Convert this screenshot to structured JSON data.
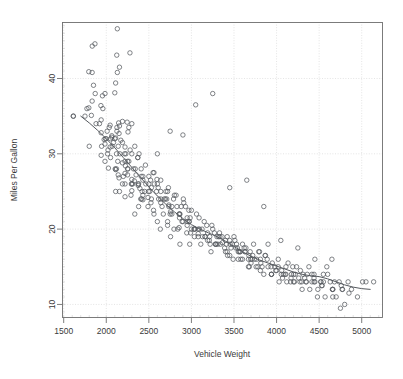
{
  "chart_data": {
    "type": "scatter",
    "title": "",
    "xlabel": "Vehicle Weight",
    "ylabel": "Miles Per Gallon",
    "xlim": [
      1480,
      5250
    ],
    "ylim": [
      8.2,
      47.5
    ],
    "xticks": [
      1500,
      2000,
      2500,
      3000,
      3500,
      4000,
      4500,
      5000
    ],
    "xtick_labels": [
      "1500",
      "2000",
      "2500",
      "3000",
      "3500",
      "4000",
      "4500",
      "5000"
    ],
    "yticks": [
      10,
      20,
      30,
      40
    ],
    "ytick_labels": [
      "10",
      "20",
      "30",
      "40"
    ],
    "grid": true,
    "grid_style": "dotted",
    "grid_color": "#d8d8d8",
    "legend": null,
    "marker": "open-circle",
    "marker_size": 3,
    "point_color": "#555a5f",
    "frame_color": "#6e6e6e",
    "series": [
      {
        "name": "Vehicles",
        "type": "scatter",
        "x": [
          1835,
          1613,
          1834,
          1955,
          2278,
          1867,
          1795,
          1850,
          2130,
          1795,
          1825,
          1773,
          1613,
          1834,
          2123,
          1937,
          1940,
          1985,
          2045,
          2155,
          2130,
          2110,
          2100,
          1940,
          2035,
          2145,
          2065,
          1945,
          2190,
          2125,
          1975,
          2155,
          1985,
          2065,
          2045,
          2300,
          2265,
          2110,
          2085,
          2215,
          1800,
          1985,
          2245,
          2150,
          2020,
          2125,
          2171,
          2220,
          2255,
          2300,
          1940,
          2050,
          2120,
          2220,
          2140,
          2225,
          2190,
          2110,
          2025,
          2335,
          2265,
          2385,
          2220,
          2150,
          2330,
          2250,
          2300,
          2370,
          2190,
          2410,
          2350,
          2300,
          2430,
          2375,
          2155,
          2600,
          2395,
          2300,
          2464,
          2220,
          2290,
          2295,
          2405,
          2430,
          2500,
          2530,
          2565,
          2595,
          2560,
          2380,
          2430,
          2490,
          2525,
          2640,
          2600,
          2695,
          2720,
          2655,
          2710,
          2755,
          2735,
          2800,
          2830,
          2865,
          2905,
          2930,
          2950,
          2985,
          3000,
          3035,
          2110,
          2220,
          2335,
          2415,
          2450,
          2490,
          2555,
          2600,
          2670,
          2720,
          2795,
          2855,
          2890,
          2945,
          2980,
          3035,
          3080,
          3125,
          3160,
          3210,
          3250,
          3285,
          3320,
          3365,
          3400,
          3425,
          3465,
          3500,
          3530,
          3570,
          3600,
          3640,
          3675,
          3700,
          3730,
          3765,
          3800,
          3830,
          3865,
          3900,
          3940,
          3980,
          4020,
          4060,
          4100,
          4135,
          4165,
          4200,
          4235,
          4275,
          4310,
          4345,
          4380,
          4415,
          4450,
          4485,
          4520,
          4550,
          4590,
          4630,
          4660,
          4700,
          4735,
          4770,
          4800,
          4840,
          4880,
          4950,
          5010,
          5140,
          2560,
          2720,
          2840,
          2950,
          3080,
          3190,
          3280,
          3390,
          3480,
          3550,
          3620,
          3710,
          3790,
          3870,
          3950,
          4020,
          4110,
          4190,
          4280,
          4360,
          4440,
          4520,
          4600,
          4680,
          4760,
          2635,
          2755,
          2865,
          2990,
          3110,
          3230,
          3340,
          3450,
          3560,
          3670,
          3780,
          3890,
          4000,
          4110,
          4220,
          4330,
          4440,
          4550,
          4660,
          2105,
          2200,
          2310,
          2420,
          2530,
          2640,
          2750,
          2860,
          2970,
          3080,
          3190,
          3300,
          3410,
          3520,
          3630,
          3740,
          1990,
          2070,
          2160,
          2250,
          2340,
          2430,
          2520,
          2610,
          2700,
          2790,
          2880,
          2970,
          3060,
          3150,
          3240,
          3330,
          3420,
          3510,
          3600,
          3690,
          1920,
          2010,
          2100,
          2190,
          2280,
          2370,
          2460,
          2550,
          2640,
          2730,
          2820,
          2910,
          3000,
          3090,
          3180,
          3270,
          3360,
          3450,
          3540,
          3630,
          3720,
          3810,
          3900,
          3990,
          4080,
          4170,
          4260,
          4350,
          4440,
          4530,
          2015,
          2135,
          2255,
          2375,
          2495,
          2615,
          2735,
          2855,
          2975,
          3095,
          3215,
          3335,
          3455,
          3575,
          3695,
          3815,
          3935,
          4055,
          4175,
          4295,
          4415,
          4535,
          4655,
          4775,
          1870,
          1960,
          2050,
          2140,
          2230,
          2320,
          2410,
          2500,
          2590,
          2680,
          2770,
          2860,
          2950,
          3040,
          3130,
          3220,
          3310,
          3400,
          3490,
          3580,
          3670,
          3760,
          3850,
          3940,
          4030,
          4120,
          4210,
          4300,
          4390,
          4480,
          4570,
          4660,
          4750,
          3250,
          3050,
          2900,
          2750,
          3450,
          3650,
          3850,
          4050,
          4250,
          4450,
          4650,
          4850,
          5050,
          1750,
          1880,
          2000,
          2120,
          2250,
          2380,
          2510,
          2640,
          2770,
          2900,
          3030,
          3160,
          3290,
          3420,
          3550,
          3680,
          3810,
          3940,
          4070,
          4200
        ],
        "y": [
          44.3,
          35.0,
          40.8,
          37.7,
          43.4,
          44.6,
          40.9,
          39.1,
          46.6,
          36.1,
          35.1,
          36.0,
          35.0,
          37.0,
          43.1,
          36.4,
          34.5,
          38.0,
          33.8,
          41.5,
          40.8,
          39.4,
          38.1,
          32.8,
          33.5,
          34.1,
          32.4,
          31.0,
          34.3,
          33.0,
          31.9,
          33.7,
          31.3,
          32.2,
          30.9,
          34.0,
          33.5,
          32.1,
          31.5,
          30.0,
          31.0,
          29.0,
          34.2,
          32.7,
          30.5,
          33.5,
          31.8,
          30.9,
          32.9,
          30.0,
          29.8,
          29.5,
          28.0,
          29.0,
          27.2,
          28.4,
          28.8,
          27.9,
          28.1,
          31.0,
          29.0,
          30.0,
          27.4,
          26.8,
          26.4,
          27.2,
          26.6,
          29.5,
          26.0,
          28.0,
          27.2,
          26.0,
          26.5,
          25.8,
          25.0,
          30.0,
          25.4,
          25.1,
          26.0,
          24.3,
          24.5,
          26.0,
          24.0,
          24.5,
          27.0,
          25.5,
          26.0,
          26.6,
          27.5,
          23.0,
          23.9,
          24.2,
          23.5,
          25.0,
          26.0,
          24.0,
          25.0,
          23.0,
          24.0,
          22.3,
          23.2,
          24.5,
          23.0,
          22.0,
          24.0,
          23.0,
          20.5,
          21.5,
          20.0,
          19.0,
          25.0,
          26.0,
          22.0,
          24.0,
          25.0,
          23.0,
          22.5,
          21.0,
          22.0,
          20.5,
          20.0,
          20.2,
          21.0,
          19.5,
          18.0,
          20.0,
          19.4,
          20.0,
          19.0,
          18.5,
          20.0,
          18.0,
          19.0,
          18.2,
          18.5,
          16.5,
          17.5,
          19.0,
          18.0,
          17.0,
          16.0,
          17.5,
          16.5,
          15.5,
          18.0,
          16.0,
          17.0,
          15.0,
          16.5,
          18.0,
          14.0,
          15.0,
          16.0,
          14.5,
          14.0,
          15.5,
          13.0,
          14.0,
          15.0,
          13.0,
          14.0,
          13.0,
          15.0,
          14.0,
          13.0,
          12.0,
          13.0,
          14.0,
          15.0,
          13.0,
          12.0,
          11.0,
          13.0,
          12.0,
          10.0,
          13.0,
          12.0,
          11.0,
          13.0,
          13.0,
          22.0,
          21.0,
          20.0,
          21.5,
          19.0,
          18.5,
          18.0,
          17.5,
          18.0,
          17.0,
          17.5,
          16.0,
          17.0,
          16.5,
          15.5,
          15.0,
          14.0,
          15.0,
          14.5,
          14.0,
          13.5,
          13.0,
          14.0,
          13.0,
          12.5,
          20.0,
          19.0,
          18.0,
          19.5,
          18.0,
          17.0,
          18.0,
          16.5,
          17.0,
          16.0,
          15.0,
          16.0,
          14.5,
          15.0,
          14.0,
          13.5,
          14.0,
          13.0,
          12.0,
          28.0,
          27.0,
          26.0,
          25.0,
          24.0,
          23.5,
          22.0,
          21.5,
          21.0,
          20.0,
          19.5,
          19.0,
          18.0,
          17.5,
          17.0,
          16.0,
          32.0,
          31.0,
          30.0,
          29.0,
          28.0,
          27.0,
          26.5,
          25.5,
          25.0,
          24.0,
          23.0,
          22.5,
          22.0,
          21.0,
          20.5,
          19.5,
          19.0,
          18.5,
          18.0,
          17.0,
          34.0,
          33.0,
          32.0,
          31.5,
          30.5,
          29.5,
          28.5,
          27.5,
          26.5,
          25.5,
          24.5,
          23.5,
          22.5,
          21.5,
          20.5,
          19.5,
          19.0,
          18.5,
          17.5,
          17.0,
          16.5,
          16.0,
          15.0,
          14.5,
          14.0,
          13.5,
          13.5,
          13.0,
          13.0,
          12.5,
          30.0,
          29.0,
          28.0,
          26.0,
          25.0,
          24.0,
          23.0,
          22.0,
          21.0,
          20.0,
          19.0,
          19.0,
          18.0,
          17.0,
          16.0,
          15.5,
          15.0,
          14.0,
          14.0,
          13.0,
          13.0,
          12.5,
          12.0,
          12.0,
          38.0,
          36.0,
          32.0,
          31.0,
          30.0,
          28.0,
          27.0,
          26.0,
          25.0,
          24.0,
          23.0,
          22.0,
          21.0,
          20.0,
          19.0,
          18.0,
          18.0,
          17.0,
          16.0,
          16.0,
          15.0,
          15.0,
          14.0,
          14.0,
          13.0,
          13.0,
          13.0,
          12.0,
          12.0,
          11.0,
          11.0,
          11.0,
          9.5,
          38.0,
          36.5,
          32.5,
          33.0,
          25.5,
          26.5,
          23.0,
          18.5,
          17.5,
          16.0,
          16.0,
          11.5,
          13.0,
          35.0,
          34.0,
          32.0,
          30.0,
          28.0,
          26.0,
          25.0,
          24.0,
          22.0,
          21.0,
          20.0,
          19.0,
          18.0,
          17.0,
          16.0,
          15.0,
          14.5,
          14.0,
          13.5,
          13.0
        ]
      }
    ],
    "smooth": {
      "name": "LOESS smoother",
      "x": [
        1700,
        1800,
        1900,
        2000,
        2100,
        2200,
        2300,
        2400,
        2500,
        2600,
        2700,
        2800,
        2900,
        3000,
        3100,
        3200,
        3300,
        3400,
        3500,
        3600,
        3700,
        3800,
        3900,
        4000,
        4100,
        4200,
        4300,
        4400,
        4500,
        4600,
        4700,
        4800,
        4900,
        5000,
        5100
      ],
      "y": [
        35.0,
        34.1,
        33.1,
        32.0,
        30.8,
        29.5,
        28.2,
        26.9,
        25.6,
        24.4,
        23.3,
        22.3,
        21.4,
        20.6,
        20.0,
        19.5,
        19.0,
        18.4,
        17.7,
        17.0,
        16.4,
        15.9,
        15.5,
        15.1,
        14.7,
        14.3,
        14.0,
        13.8,
        13.7,
        13.4,
        13.0,
        12.6,
        12.3,
        12.1,
        12.0
      ],
      "color": "#55595e"
    }
  },
  "figure": {
    "background": "#ffffff",
    "plot_area": {
      "left": 62,
      "top": 22,
      "right": 383,
      "bottom": 318
    }
  }
}
